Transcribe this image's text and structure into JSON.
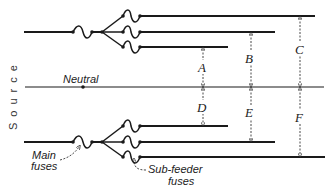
{
  "diagram": {
    "source_label": "Source",
    "neutral_label": "Neutral",
    "main_fuses_label_line1": "Main",
    "main_fuses_label_line2": "fuses",
    "sub_feeder_label_line1": "Sub-feeder",
    "sub_feeder_label_line2": "fuses",
    "dimensions": {
      "A": "A",
      "B": "B",
      "C": "C",
      "D": "D",
      "E": "E",
      "F": "F"
    },
    "line_color": "#1a1a1a"
  }
}
